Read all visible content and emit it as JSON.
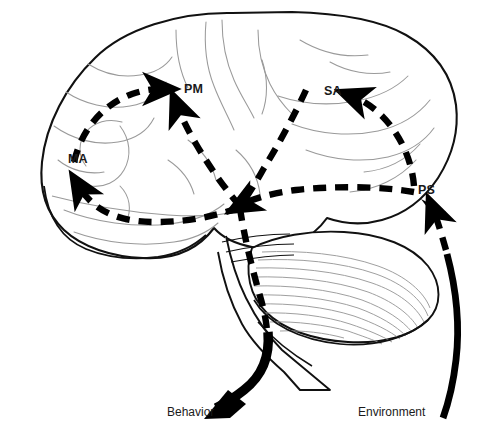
{
  "figure": {
    "kind": "brain-connectivity-diagram",
    "background_color": "#ffffff",
    "outline_color": "#000000",
    "sulci_color": "#9a9a9a",
    "arrow_color": "#000000",
    "label_color": "#1a1a1a",
    "faint_header_text": ""
  },
  "labels": {
    "pm": "PM",
    "sa": "SA",
    "ma": "MA",
    "ps": "PS",
    "behavior": "Behavior",
    "environment": "Environment"
  },
  "pathways": [
    {
      "id": "ps-to-sa",
      "style": "dashed",
      "from": "PS",
      "to": "SA",
      "arrowhead": "at-SA",
      "description": "dashed arc curving up and left from PS to SA"
    },
    {
      "id": "ps-to-center",
      "style": "dashed",
      "from": "PS",
      "to": "central-hub",
      "arrowhead": "at-center",
      "description": "long horizontal dashed line from PS leftwards to central convergence"
    },
    {
      "id": "sa-to-center",
      "style": "dashed",
      "from": "SA",
      "to": "central-hub",
      "arrowhead": "none",
      "description": "dashed line descending from SA area down to central convergence"
    },
    {
      "id": "center-to-pm",
      "style": "dashed",
      "from": "central-hub",
      "to": "PM",
      "arrowhead": "at-PM",
      "description": "dashed line rising from central hub up to PM"
    },
    {
      "id": "center-to-ma",
      "style": "dashed",
      "from": "central-hub",
      "to": "MA",
      "arrowhead": "at-MA",
      "description": "dashed arc sweeping left along temporal lobe to MA"
    },
    {
      "id": "ma-to-pm",
      "style": "dashed",
      "from": "MA",
      "to": "PM",
      "arrowhead": "at-PM",
      "description": "dashed arc across frontal lobe from MA region to PM"
    },
    {
      "id": "pm-to-behavior",
      "style": "dashed-then-solid",
      "from": "PM",
      "to": "Behavior",
      "arrowhead": "at-Behavior",
      "description": "dashed descending line through brainstem becoming thick solid arrow to Behavior"
    },
    {
      "id": "environment-to-ps",
      "style": "solid-then-dashed",
      "from": "Environment",
      "to": "PS",
      "arrowhead": "at-PS",
      "description": "thick solid curve rising from Environment becoming dashed arrow into PS"
    }
  ]
}
